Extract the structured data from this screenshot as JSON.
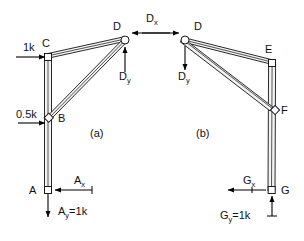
{
  "figure": {
    "background_color": "#ffffff",
    "member_fill": "#f2f2f2",
    "member_stroke": "#2b2b2b",
    "text_color": "#111111"
  },
  "subfigures": [
    {
      "id": "a",
      "caption": "(a)",
      "x": 90,
      "y": 136
    },
    {
      "id": "b",
      "caption": "(b)",
      "x": 196,
      "y": 136
    }
  ],
  "left": {
    "joints": [
      {
        "name": "A",
        "label": "A",
        "shape": "square",
        "x": 48,
        "y": 190,
        "label_x": 31,
        "label_y": 194
      },
      {
        "name": "B",
        "label": "B",
        "shape": "square",
        "x": 49,
        "y": 118,
        "label_x": 58,
        "label_y": 122
      },
      {
        "name": "C",
        "label": "C",
        "shape": "square",
        "x": 48,
        "y": 57,
        "label_x": 42,
        "label_y": 47
      },
      {
        "name": "D",
        "label": "D",
        "shape": "circle",
        "x": 125,
        "y": 40,
        "label_x": 113,
        "label_y": 30
      }
    ],
    "forces": [
      {
        "name": "load-1k",
        "label": "1k",
        "sub": "",
        "direction": "right",
        "x": 23,
        "y": 51,
        "tail_x": 16,
        "tail_y": 57,
        "head_x": 46,
        "head_y": 57
      },
      {
        "name": "load-0.5k",
        "label": "0.5k",
        "sub": "",
        "direction": "right",
        "x": 16,
        "y": 113,
        "tail_x": 18,
        "tail_y": 123,
        "head_x": 46,
        "head_y": 123
      },
      {
        "name": "reaction-Ax",
        "label": "A",
        "sub": "x",
        "direction": "left",
        "x": 74,
        "y": 184,
        "tail_x": 92,
        "tail_y": 190,
        "head_x": 54,
        "head_y": 190
      },
      {
        "name": "reaction-Ay",
        "label": "A",
        "sub": "y",
        "suffix": "=1k",
        "direction": "down",
        "x": 58,
        "y": 215,
        "tail_x": 48,
        "tail_y": 194,
        "head_x": 48,
        "head_y": 217
      },
      {
        "name": "force-Dx",
        "label": "D",
        "sub": "x",
        "direction": "left",
        "x": 146,
        "y": 22,
        "tail_x": 170,
        "tail_y": 33,
        "head_x": 131,
        "head_y": 33
      },
      {
        "name": "force-Dy",
        "label": "D",
        "sub": "y",
        "direction": "up",
        "x": 121,
        "y": 77,
        "tail_x": 125,
        "tail_y": 72,
        "head_x": 125,
        "head_y": 46
      }
    ]
  },
  "right": {
    "joints": [
      {
        "name": "D",
        "label": "D",
        "shape": "circle",
        "x": 185,
        "y": 40,
        "label_x": 194,
        "label_y": 30
      },
      {
        "name": "E",
        "label": "E",
        "shape": "square",
        "x": 272,
        "y": 63,
        "label_x": 266,
        "label_y": 53
      },
      {
        "name": "F",
        "label": "F",
        "shape": "square",
        "x": 275,
        "y": 110,
        "label_x": 281,
        "label_y": 114
      },
      {
        "name": "G",
        "label": "G",
        "shape": "square",
        "x": 272,
        "y": 190,
        "label_x": 281,
        "label_y": 194
      }
    ],
    "forces": [
      {
        "name": "force-Dx",
        "label": "D",
        "sub": "x",
        "direction": "right",
        "x": 146,
        "y": 22,
        "tail_x": 142,
        "tail_y": 33,
        "head_x": 180,
        "head_y": 33
      },
      {
        "name": "force-Dy",
        "label": "D",
        "sub": "y",
        "direction": "down",
        "x": 180,
        "y": 77,
        "tail_x": 185,
        "tail_y": 46,
        "head_x": 185,
        "head_y": 70
      },
      {
        "name": "reaction-Gx",
        "label": "G",
        "sub": "x",
        "direction": "left",
        "x": 243,
        "y": 184,
        "tail_x": 266,
        "tail_y": 190,
        "head_x": 228,
        "head_y": 190
      },
      {
        "name": "reaction-Gy",
        "label": "G",
        "sub": "y",
        "suffix": "=1k",
        "direction": "up",
        "x": 222,
        "y": 219,
        "tail_x": 272,
        "tail_y": 216,
        "head_x": 272,
        "head_y": 195
      }
    ]
  }
}
